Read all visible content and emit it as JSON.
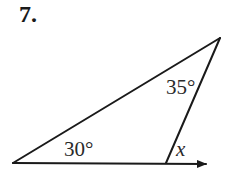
{
  "problem": {
    "number": "7."
  },
  "diagram": {
    "type": "triangle-exterior-angle",
    "angles": {
      "left_interior": "30°",
      "top_interior": "35°",
      "exterior": "x"
    },
    "line_color": "#1a1a1a"
  }
}
